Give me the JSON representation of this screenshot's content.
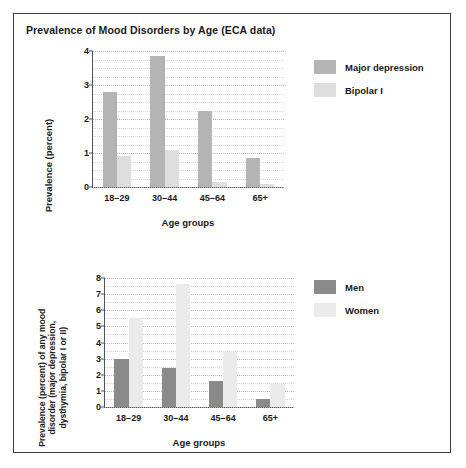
{
  "figure": {
    "title": "Prevalence of Mood Disorders by Age (ECA data)",
    "border_color": "#3a3a3a",
    "background": "#ffffff"
  },
  "chart_data": [
    {
      "id": "top",
      "type": "bar",
      "title": "Prevalence of Mood Disorders by Age (ECA data)",
      "xlabel": "Age groups",
      "ylabel": "Prevalence (percent)",
      "categories": [
        "18–29",
        "30–44",
        "45–64",
        "65+"
      ],
      "ylim": [
        0,
        4
      ],
      "yticks": [
        0,
        1,
        2,
        3,
        4
      ],
      "ytick_labels": [
        "0",
        "1",
        "2",
        "3",
        "4"
      ],
      "minor_gridline_step": 0.25,
      "grid": true,
      "legend_position": "right",
      "series": [
        {
          "name": "Major depression",
          "color": "#b4b4b4",
          "values": [
            2.8,
            3.85,
            2.25,
            0.85
          ]
        },
        {
          "name": "Bipolar I",
          "color": "#dedede",
          "values": [
            0.9,
            1.1,
            0.15,
            0.1
          ]
        }
      ]
    },
    {
      "id": "bottom",
      "type": "bar",
      "title": "",
      "xlabel": "Age groups",
      "ylabel": "Prevalence (percent) of any mood disorder (major depression, dysthymia, bipolar I or II)",
      "ylabel_lines": [
        "Prevalence (percent) of any mood",
        "disorder (major depression,",
        "dysthymia, bipolar I or II)"
      ],
      "categories": [
        "18–29",
        "30–44",
        "45–64",
        "65+"
      ],
      "ylim": [
        0,
        8
      ],
      "yticks": [
        0,
        1,
        2,
        3,
        4,
        5,
        6,
        7,
        8
      ],
      "ytick_labels": [
        "0",
        "1",
        "2",
        "3",
        "4",
        "5",
        "6",
        "7",
        "8"
      ],
      "minor_gridline_step": 0.5,
      "grid": true,
      "legend_position": "right",
      "series": [
        {
          "name": "Men",
          "color": "#8a8a8a",
          "values": [
            3.0,
            2.4,
            1.6,
            0.5
          ]
        },
        {
          "name": "Women",
          "color": "#ebebeb",
          "values": [
            5.5,
            7.6,
            3.4,
            1.4
          ]
        }
      ]
    }
  ]
}
